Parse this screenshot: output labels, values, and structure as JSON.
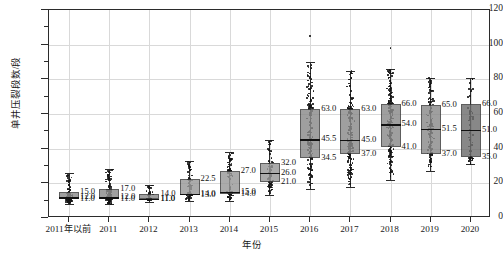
{
  "chart_data": {
    "type": "box",
    "title": "",
    "xlabel": "年份",
    "ylabel": "单井压裂段数/段",
    "ylim": [
      0,
      120
    ],
    "ytick_labels": [
      "0",
      "20",
      "40",
      "60",
      "80",
      "100",
      "120"
    ],
    "ytick_values": [
      0,
      20,
      40,
      60,
      80,
      100,
      120
    ],
    "yminor_values": [
      10,
      30,
      50,
      70,
      90,
      110
    ],
    "grid": "horizontal-and-vertical",
    "legend": "none",
    "categories": [
      "2011年以前",
      "2011",
      "2012",
      "2013",
      "2014",
      "2015",
      "2016",
      "2017",
      "2018",
      "2019",
      "2020"
    ],
    "series": [
      {
        "name": "2011年以前",
        "q1": 11.0,
        "median": 12.0,
        "q3": 15.0,
        "whisker_low": 8.0,
        "whisker_high": 26.0,
        "q1_label": "11.0",
        "median_label": "12.0",
        "q3_label": "15.0",
        "box_fill": "#8c8c8c"
      },
      {
        "name": "2011",
        "q1": 11.0,
        "median": 12.0,
        "q3": 17.0,
        "whisker_low": 8.0,
        "whisker_high": 28.0,
        "q1_label": "11.0",
        "median_label": "12.0",
        "q3_label": "17.0",
        "box_fill": "#8c8c8c"
      },
      {
        "name": "2012",
        "q1": 11.0,
        "median": 11.0,
        "q3": 14.0,
        "whisker_low": 9.0,
        "whisker_high": 19.0,
        "q1_label": "11.0",
        "median_label": "11.0",
        "q3_label": "14.0",
        "box_fill": "#8c8c8c"
      },
      {
        "name": "2013",
        "q1": 13.0,
        "median": 14.0,
        "q3": 22.5,
        "whisker_low": 10.0,
        "whisker_high": 33.0,
        "q1_label": "13.0",
        "median_label": "14.0",
        "q3_label": "22.5",
        "box_fill": "#999999"
      },
      {
        "name": "2014",
        "q1": 14.0,
        "median": 15.0,
        "q3": 27.0,
        "whisker_low": 10.0,
        "whisker_high": 38.0,
        "q1_label": "14.0",
        "median_label": "15.0",
        "q3_label": "27.0",
        "box_fill": "#999999"
      },
      {
        "name": "2015",
        "q1": 21.0,
        "median": 26.0,
        "q3": 32.0,
        "whisker_low": 13.0,
        "whisker_high": 45.0,
        "q1_label": "21.0",
        "median_label": "26.0",
        "q3_label": "32.0",
        "box_fill": "#999999"
      },
      {
        "name": "2016",
        "q1": 34.5,
        "median": 45.5,
        "q3": 63.0,
        "whisker_low": 17.0,
        "whisker_high": 90.0,
        "q1_label": "34.5",
        "median_label": "45.5",
        "q3_label": "63.0",
        "box_fill": "#8a8a8a"
      },
      {
        "name": "2017",
        "q1": 37.0,
        "median": 45.0,
        "q3": 63.0,
        "whisker_low": 18.0,
        "whisker_high": 85.0,
        "q1_label": "37.0",
        "median_label": "45.0",
        "q3_label": "63.0",
        "box_fill": "#8a8a8a"
      },
      {
        "name": "2018",
        "q1": 41.0,
        "median": 54.0,
        "q3": 66.0,
        "whisker_low": 22.0,
        "whisker_high": 86.0,
        "q1_label": "41.0",
        "median_label": "54.0",
        "q3_label": "66.0",
        "box_fill": "#8a8a8a"
      },
      {
        "name": "2019",
        "q1": 37.0,
        "median": 51.5,
        "q3": 65.0,
        "whisker_low": 27.0,
        "whisker_high": 81.0,
        "q1_label": "37.0",
        "median_label": "51.5",
        "q3_label": "65.0",
        "box_fill": "#8a8a8a"
      },
      {
        "name": "2020",
        "q1": 35.0,
        "median": 51.0,
        "q3": 66.0,
        "whisker_low": 31.0,
        "whisker_high": 81.0,
        "q1_label": "35.0",
        "median_label": "51.0",
        "q3_label": "66.0",
        "box_fill": "#6e6e6e"
      }
    ],
    "scatter_overlay": {
      "enabled": true,
      "style": "jittered-strip",
      "color": "#141414",
      "counts": [
        120,
        120,
        55,
        70,
        85,
        80,
        150,
        170,
        180,
        120,
        55
      ],
      "outliers_high": [
        {
          "group": "2016",
          "value": 105
        },
        {
          "group": "2018",
          "value": 98
        }
      ]
    },
    "colors": {
      "axis": "#2b2b2b",
      "grid": "#d9d9d9",
      "point": "#141414",
      "median_line": "#111111",
      "label_text": "#111111"
    }
  }
}
